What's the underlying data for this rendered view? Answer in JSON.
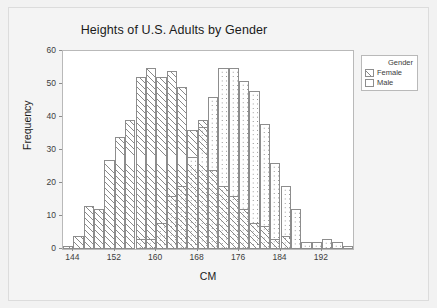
{
  "chart_data": {
    "type": "bar",
    "subtype": "overlaid-histogram",
    "title": "Heights of U.S. Adults by Gender",
    "xlabel": "CM",
    "ylabel": "Frequency",
    "xlim": [
      142,
      198
    ],
    "ylim": [
      0,
      60
    ],
    "xticks": [
      144,
      152,
      160,
      168,
      176,
      184,
      192
    ],
    "yticks": [
      0,
      10,
      20,
      30,
      40,
      50,
      60
    ],
    "grid": false,
    "bin_width": 2,
    "bin_starts": [
      142,
      144,
      146,
      148,
      150,
      152,
      154,
      156,
      158,
      160,
      162,
      164,
      166,
      168,
      170,
      172,
      174,
      176,
      178,
      180,
      182,
      184,
      186,
      188,
      190,
      192,
      194,
      196
    ],
    "legend": {
      "title": "Gender",
      "position": "outside-top-right",
      "entries": [
        {
          "label": "Female",
          "pattern": "diagonal-hatch"
        },
        {
          "label": "Male",
          "pattern": "dotted"
        }
      ]
    },
    "series": [
      {
        "name": "Female",
        "pattern": "diagonal-hatch",
        "values": [
          1,
          4,
          13,
          12,
          27,
          34,
          39,
          52,
          55,
          52,
          54,
          49,
          36,
          39,
          24,
          19,
          16,
          12,
          8,
          7,
          3,
          4,
          0,
          0,
          0,
          0,
          0,
          0
        ]
      },
      {
        "name": "Male",
        "pattern": "dotted",
        "values": [
          0,
          0,
          0,
          0,
          0,
          0,
          0,
          3,
          3,
          8,
          16,
          19,
          28,
          37,
          46,
          55,
          55,
          51,
          48,
          38,
          26,
          19,
          12,
          2,
          2,
          3,
          2,
          1
        ]
      }
    ]
  }
}
